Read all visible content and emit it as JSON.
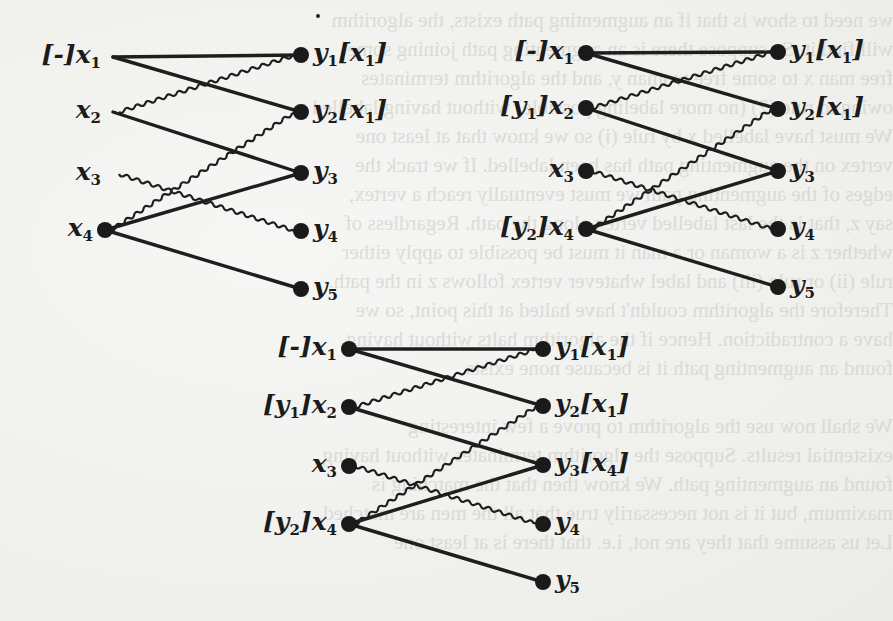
{
  "figure": {
    "edge_styles": {
      "solid": "#1e1e1e",
      "wavy": "#1e1e1e"
    },
    "graphs": [
      {
        "id": "graph-1",
        "left": [
          {
            "name": "x1",
            "label": "[-]x",
            "sub": "1",
            "dot": false,
            "x": 113,
            "y": 57
          },
          {
            "name": "x2",
            "label": "x",
            "sub": "2",
            "dot": false,
            "x": 113,
            "y": 112
          },
          {
            "name": "x3",
            "label": "x",
            "sub": "3",
            "dot": false,
            "x": 113,
            "y": 174
          },
          {
            "name": "x4",
            "label": "x",
            "sub": "4",
            "dot": true,
            "x": 105,
            "y": 230
          }
        ],
        "right": [
          {
            "name": "y1",
            "label": "y",
            "sub": "1",
            "tag": "[x1]",
            "x": 301,
            "y": 55
          },
          {
            "name": "y2",
            "label": "y",
            "sub": "2",
            "tag": "[x1]",
            "x": 301,
            "y": 112
          },
          {
            "name": "y3",
            "label": "y",
            "sub": "3",
            "tag": "",
            "x": 301,
            "y": 173
          },
          {
            "name": "y4",
            "label": "y",
            "sub": "4",
            "tag": "",
            "x": 301,
            "y": 231
          },
          {
            "name": "y5",
            "label": "y",
            "sub": "5",
            "tag": "",
            "x": 301,
            "y": 289
          }
        ]
      },
      {
        "id": "graph-2",
        "left": [
          {
            "name": "x1",
            "label": "[-]x",
            "sub": "1",
            "dot": true,
            "x": 586,
            "y": 53
          },
          {
            "name": "x2",
            "label": "[y1]x",
            "sub": "2",
            "dot": true,
            "x": 586,
            "y": 108
          },
          {
            "name": "x3",
            "label": "x",
            "sub": "3",
            "dot": true,
            "x": 586,
            "y": 171
          },
          {
            "name": "x4",
            "label": "[y2]x",
            "sub": "4",
            "dot": true,
            "x": 586,
            "y": 229
          }
        ],
        "right": [
          {
            "name": "y1",
            "label": "y",
            "sub": "1",
            "tag": "[x1]",
            "x": 778,
            "y": 52
          },
          {
            "name": "y2",
            "label": "y",
            "sub": "2",
            "tag": "[x1]",
            "x": 778,
            "y": 109
          },
          {
            "name": "y3",
            "label": "y",
            "sub": "3",
            "tag": "",
            "x": 778,
            "y": 171
          },
          {
            "name": "y4",
            "label": "y",
            "sub": "4",
            "tag": "",
            "x": 778,
            "y": 229
          },
          {
            "name": "y5",
            "label": "y",
            "sub": "5",
            "tag": "",
            "x": 778,
            "y": 287
          }
        ]
      },
      {
        "id": "graph-3",
        "left": [
          {
            "name": "x1",
            "label": "[-]x",
            "sub": "1",
            "dot": true,
            "x": 349,
            "y": 349
          },
          {
            "name": "x2",
            "label": "[y1]x",
            "sub": "2",
            "dot": true,
            "x": 349,
            "y": 407
          },
          {
            "name": "x3",
            "label": "x",
            "sub": "3",
            "dot": true,
            "x": 349,
            "y": 466
          },
          {
            "name": "x4",
            "label": "[y2]x",
            "sub": "4",
            "dot": true,
            "x": 349,
            "y": 524
          }
        ],
        "right": [
          {
            "name": "y1",
            "label": "y",
            "sub": "1",
            "tag": "[x1]",
            "x": 543,
            "y": 349
          },
          {
            "name": "y2",
            "label": "y",
            "sub": "2",
            "tag": "[x1]",
            "x": 543,
            "y": 406
          },
          {
            "name": "y3",
            "label": "y",
            "sub": "3",
            "tag": "[x4]",
            "x": 543,
            "y": 465
          },
          {
            "name": "y4",
            "label": "y",
            "sub": "4",
            "tag": "",
            "x": 543,
            "y": 524
          },
          {
            "name": "y5",
            "label": "y",
            "sub": "5",
            "tag": "",
            "x": 543,
            "y": 582
          }
        ]
      }
    ],
    "edges": {
      "solid": [
        [
          "x1",
          "y1"
        ],
        [
          "x1",
          "y2"
        ],
        [
          "x2",
          "y3"
        ],
        [
          "x4",
          "y3"
        ],
        [
          "x4",
          "y5"
        ]
      ],
      "wavy": [
        [
          "x2",
          "y1"
        ],
        [
          "x3",
          "y4"
        ],
        [
          "x4",
          "y2"
        ]
      ]
    }
  },
  "background": {
    "bleed_through_text": [
      "we need to show is that if an augmenting path exists, the algorithm",
      "will find it. So suppose there is an augmenting path joining some",
      "free man x to some free woman y, and the algorithm terminates",
      "owing to rule (2) (no more labeling possible) without having labelled y.",
      "We must have labelled x by rule (i) so we know that at least one",
      "vertex on the augmenting path has been labelled. If we track the",
      "edges of the augmenting path we must eventually reach a vertex,",
      "say z, that is the last labelled vertex along the path. Regardless of",
      "whether z is a woman or a man it must be possible to apply either",
      "rule (ii) or rule (iii) and label whatever vertex follows z in the path.",
      "Therefore the algorithm couldn't have halted at this point, so we",
      "have a contradiction. Hence if the algorithm halts without having",
      "found an augmenting path it is because none exists.",
      "",
      "We shall now use the algorithm to prove a few interesting",
      "existential results. Suppose the algorithm terminates without having",
      "found an augmenting path. We know then that the matching is",
      "maximum, but it is not necessarily true that all the men are matched.",
      "Let us assume that they are not, i.e. that there is at least one"
    ]
  }
}
